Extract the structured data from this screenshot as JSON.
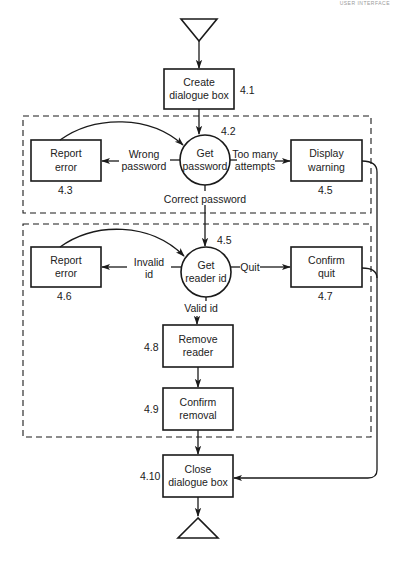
{
  "header": {
    "running_head": "USER INTERFACE"
  },
  "diagram": {
    "title": "",
    "start_terminal": {
      "shape": "triangle-down"
    },
    "end_terminal": {
      "shape": "triangle-up"
    },
    "nodes": {
      "create_dialogue": {
        "id": "4.1",
        "label": "Create dialogue box",
        "line1": "Create",
        "line2": "dialogue box",
        "shape": "rectangle"
      },
      "get_password": {
        "id": "4.2",
        "label": "Get password",
        "line1": "Get",
        "line2": "password",
        "shape": "circle"
      },
      "report_error_pw": {
        "id": "4.3",
        "label": "Report error",
        "line1": "Report",
        "line2": "error",
        "shape": "rectangle"
      },
      "display_warning": {
        "id": "4.5",
        "label": "Display warning",
        "line1": "Display",
        "line2": "warning",
        "shape": "rectangle"
      },
      "get_reader_id": {
        "id": "4.5",
        "label": "Get reader id",
        "line1": "Get",
        "line2": "reader id",
        "shape": "circle"
      },
      "report_error_id": {
        "id": "4.6",
        "label": "Report error",
        "line1": "Report",
        "line2": "error",
        "shape": "rectangle"
      },
      "confirm_quit": {
        "id": "4.7",
        "label": "Confirm quit",
        "line1": "Confirm",
        "line2": "quit",
        "shape": "rectangle"
      },
      "remove_reader": {
        "id": "4.8",
        "label": "Remove reader",
        "line1": "Remove",
        "line2": "reader",
        "shape": "rectangle"
      },
      "confirm_removal": {
        "id": "4.9",
        "label": "Confirm removal",
        "line1": "Confirm",
        "line2": "removal",
        "shape": "rectangle"
      },
      "close_dialogue": {
        "id": "4.10",
        "label": "Close dialogue box",
        "line1": "Close",
        "line2": "dialogue box",
        "shape": "rectangle"
      }
    },
    "edges": {
      "wrong_password": {
        "line1": "Wrong",
        "line2": "password"
      },
      "too_many": {
        "line1": "Too many",
        "line2": "attempts"
      },
      "correct_password": {
        "label": "Correct password"
      },
      "invalid_id": {
        "line1": "Invalid",
        "line2": "id"
      },
      "quit": {
        "label": "Quit"
      },
      "valid_id": {
        "label": "Valid id"
      }
    },
    "groups": [
      {
        "name": "password-loop",
        "style": "dashed"
      },
      {
        "name": "reader-id-loop",
        "style": "dashed"
      }
    ],
    "colors": {
      "stroke": "#1a1a1a",
      "background": "#ffffff"
    }
  }
}
